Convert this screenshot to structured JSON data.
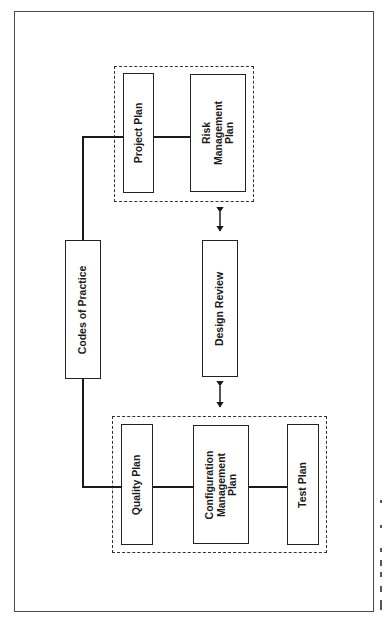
{
  "diagram": {
    "type": "block-diagram",
    "orientation": "rotated-90-ccw",
    "colors": {
      "line": "#1a1a1a",
      "frame": "#4a4a4a",
      "background": "#ffffff"
    },
    "nodes": {
      "codes_of_practice": {
        "lines": [
          "Codes of Practice"
        ]
      },
      "design_review": {
        "lines": [
          "Design Review"
        ]
      },
      "project_plan": {
        "lines": [
          "Project Plan"
        ]
      },
      "risk_management_plan": {
        "lines": [
          "Risk",
          "Management",
          "Plan"
        ]
      },
      "quality_plan": {
        "lines": [
          "Quality Plan"
        ]
      },
      "configuration_management_plan": {
        "lines": [
          "Configuration",
          "Management",
          "Plan"
        ]
      },
      "test_plan": {
        "lines": [
          "Test Plan"
        ]
      }
    },
    "groups": [
      {
        "id": "upper-group",
        "members": [
          "project_plan",
          "risk_management_plan"
        ],
        "style": "dashed"
      },
      {
        "id": "lower-group",
        "members": [
          "quality_plan",
          "configuration_management_plan",
          "test_plan"
        ],
        "style": "dashed"
      }
    ],
    "edges": [
      {
        "from": "codes_of_practice",
        "to": "project_plan",
        "type": "line"
      },
      {
        "from": "codes_of_practice",
        "to": "quality_plan",
        "type": "line"
      },
      {
        "from": "project_plan",
        "to": "risk_management_plan",
        "type": "line"
      },
      {
        "from": "quality_plan",
        "to": "configuration_management_plan",
        "type": "line"
      },
      {
        "from": "configuration_management_plan",
        "to": "test_plan",
        "type": "line"
      },
      {
        "from": "design_review",
        "to": "upper-group",
        "type": "bidirectional-arrow"
      },
      {
        "from": "design_review",
        "to": "lower-group",
        "type": "bidirectional-arrow"
      }
    ]
  }
}
